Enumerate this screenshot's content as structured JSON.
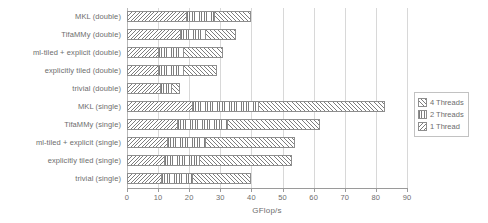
{
  "chart_data": {
    "type": "bar",
    "orientation": "horizontal",
    "stacked": true,
    "title": "",
    "xlabel": "GFlop/s",
    "ylabel": "",
    "xlim": [
      0,
      90
    ],
    "xticks": [
      0,
      10,
      20,
      30,
      40,
      50,
      60,
      70,
      80,
      90
    ],
    "grid": true,
    "grid_axis": "x",
    "legend_position": "right",
    "categories": [
      "MKL (double)",
      "TifaMMy (double)",
      "ml-tiled + explicit (double)",
      "explicitly tiled (double)",
      "trivial (double)",
      "MKL (single)",
      "TifaMMy (single)",
      "ml-tiled + explicit (single)",
      "explicitly tiled (single)",
      "trivial (single)"
    ],
    "series": [
      {
        "name": "1 Thread",
        "pattern": "backslash-hatch",
        "values": [
          19,
          17,
          10,
          10,
          10.5,
          21,
          16,
          13,
          12,
          11
        ]
      },
      {
        "name": "2 Threads",
        "pattern": "vertical-lines",
        "values": [
          9,
          8,
          8,
          8,
          3.5,
          21,
          16,
          12,
          11,
          10
        ]
      },
      {
        "name": "4 Threads",
        "pattern": "forward-hatch",
        "values": [
          12,
          10,
          13,
          11,
          3,
          41,
          30,
          29,
          30,
          19
        ]
      }
    ],
    "cumulative_totals": [
      40,
      35,
      31,
      29,
      17,
      83,
      62,
      54,
      53,
      40
    ]
  },
  "legend": {
    "entries": [
      {
        "label": "4 Threads",
        "pattern": "forward-hatch"
      },
      {
        "label": "2 Threads",
        "pattern": "vertical-lines"
      },
      {
        "label": "1 Thread",
        "pattern": "backslash-hatch"
      }
    ]
  },
  "axis": {
    "x_title": "GFlop/s",
    "tick_labels": [
      "0",
      "10",
      "20",
      "30",
      "40",
      "50",
      "60",
      "70",
      "80",
      "90"
    ]
  },
  "colors": {
    "hatch": "#7d7d7d",
    "bar_border": "#8e8e8e",
    "gridline": "#d8d8d8",
    "axis": "#9a9a9a",
    "text": "#6d6d6d",
    "background": "#ffffff"
  }
}
